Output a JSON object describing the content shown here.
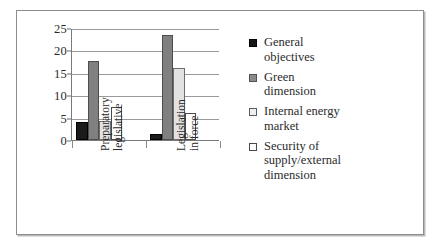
{
  "chart_data": {
    "type": "bar",
    "title": "",
    "subtitle": "",
    "xlabel": "",
    "ylabel": "",
    "ylim": [
      0,
      25
    ],
    "ytick_labels": [
      "0",
      "5",
      "10",
      "15",
      "20",
      "25"
    ],
    "ytick_values": [
      0,
      5,
      10,
      15,
      20,
      25
    ],
    "grid": true,
    "grid_axis": "y",
    "legend_position": "right",
    "categories": [
      "Preparatory legislative",
      "Legislation in force"
    ],
    "category_label_lines": [
      [
        "Preparatory",
        "legislative"
      ],
      [
        "Legislation",
        "in force"
      ]
    ],
    "series": [
      {
        "name": "General objectives",
        "values": [
          4,
          1.3
        ],
        "color": "#161616"
      },
      {
        "name": "Green dimension",
        "values": [
          17.7,
          23.4
        ],
        "color": "#8a8a8a"
      },
      {
        "name": "Internal energy market",
        "values": [
          4.3,
          16
        ],
        "color": "#efefef"
      },
      {
        "name": "Security of supply/external dimension",
        "values": [
          7.3,
          6
        ],
        "color": "#ffffff"
      }
    ]
  },
  "legend": {
    "entries": [
      {
        "label_lines": [
          "General",
          "objectives"
        ]
      },
      {
        "label_lines": [
          "Green",
          "dimension"
        ]
      },
      {
        "label_lines": [
          "Internal energy",
          "market"
        ]
      },
      {
        "label_lines": [
          "Security of",
          "supply/external",
          "dimension"
        ]
      }
    ]
  },
  "colors": {
    "frame_border": "#8d8d8d",
    "axis": "#7a7a7a",
    "gridline": "#9a9a9a",
    "text": "#2b2b2b",
    "background": "#ffffff"
  }
}
